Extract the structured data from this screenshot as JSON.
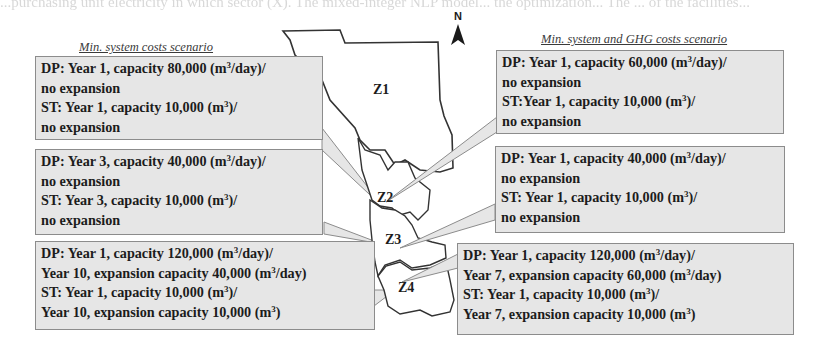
{
  "bleed_text": "...purchasing unit electricity in which sector (X). The mixed-integer NLP model... the optimization... The ... of the facilities...",
  "north_label": "N",
  "scenarios": {
    "left": {
      "title": "Min. system costs scenario",
      "boxes": [
        {
          "zone": "Z1",
          "dp_line1": "DP: Year 1, capacity 80,000  (m",
          "dp_line1_unit": "/day)/",
          "dp_line2": "no expansion",
          "st_line1": "ST: Year 1, capacity 10,000  (m",
          "st_line1_unit": ")/",
          "st_line2": "no expansion"
        },
        {
          "zone": "Z2",
          "dp_line1": "DP: Year 3, capacity 40,000  (m",
          "dp_line1_unit": "/day)/",
          "dp_line2": "no expansion",
          "st_line1": "ST: Year 3, capacity 10,000  (m",
          "st_line1_unit": ")/",
          "st_line2": "no expansion"
        },
        {
          "zone": "Z3",
          "dp_line1": "DP: Year 1, capacity 120,000  (m",
          "dp_line1_unit": "/day)/",
          "dp_line2": "Year 10, expansion capacity 40,000  (m",
          "dp_line2_unit": "/day)",
          "st_line1": "ST: Year 1, capacity 10,000  (m",
          "st_line1_unit": ")/",
          "st_line2": "Year 10, expansion capacity 10,000  (m",
          "st_line2_unit": ")"
        }
      ]
    },
    "right": {
      "title": "Min. system and GHG costs scenario",
      "boxes": [
        {
          "zone": "Z1",
          "dp_line1": "DP: Year 1, capacity 60,000  (m",
          "dp_line1_unit": "/day)/",
          "dp_line2": "no expansion",
          "st_line1": "ST:Year 1, capacity 10,000  (m",
          "st_line1_unit": ")/",
          "st_line2": "no expansion"
        },
        {
          "zone": "Z2",
          "dp_line1": "DP: Year 1, capacity 40,000  (m",
          "dp_line1_unit": "/day)/",
          "dp_line2": "no expansion",
          "st_line1": "ST: Year 1, capacity 10,000  (m",
          "st_line1_unit": ")/",
          "st_line2": "no expansion"
        },
        {
          "zone": "Z3",
          "dp_line1": "DP: Year 1, capacity 120,000  (m",
          "dp_line1_unit": "/day)/",
          "dp_line2": "Year 7, expansion capacity 60,000  (m",
          "dp_line2_unit": "/day)",
          "st_line1": "ST: Year 1, capacity 10,000  (m",
          "st_line1_unit": ")/",
          "st_line2": "Year 7, expansion capacity 10,000  (m",
          "st_line2_unit": ")"
        }
      ]
    }
  },
  "zones": [
    {
      "label": "Z1"
    },
    {
      "label": "Z2"
    },
    {
      "label": "Z3"
    },
    {
      "label": "Z4"
    }
  ],
  "superscript": "3",
  "colors": {
    "box_fill": "#e6e6e6",
    "box_border": "#8c8c8c",
    "map_outline": "#333333",
    "callout_fill": "#e6e6e6"
  }
}
